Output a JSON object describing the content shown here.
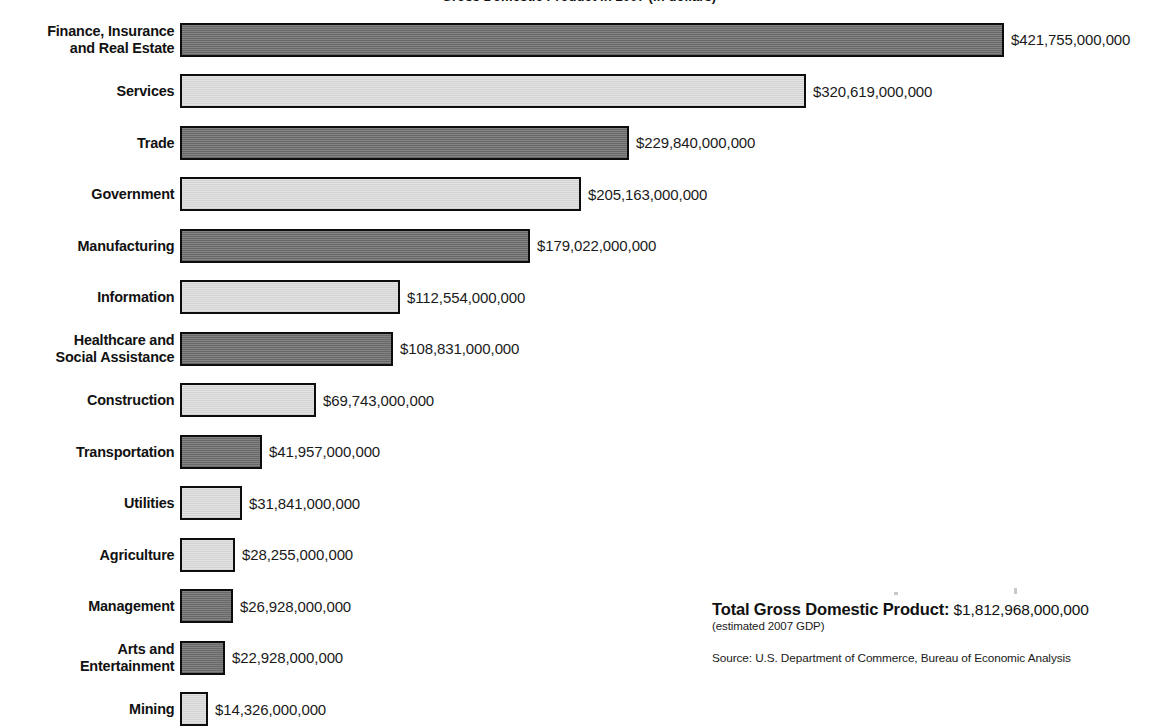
{
  "chart_data": {
    "type": "bar",
    "orientation": "horizontal",
    "title": "Gross Domestic Product in 2007 (in dollars)",
    "xlabel": "",
    "ylabel": "",
    "grid": false,
    "legend": "none",
    "value_prefix": "$",
    "categories": [
      "Finance, Insurance\nand Real Estate",
      "Services",
      "Trade",
      "Government",
      "Manufacturing",
      "Information",
      "Healthcare and\nSocial Assistance",
      "Construction",
      "Transportation",
      "Utilities",
      "Agriculture",
      "Management",
      "Arts and\nEntertainment",
      "Mining"
    ],
    "values": [
      421755000000,
      320619000000,
      229840000000,
      205163000000,
      179022000000,
      112554000000,
      108831000000,
      69743000000,
      41957000000,
      31841000000,
      28255000000,
      26928000000,
      22928000000,
      14326000000
    ],
    "value_labels": [
      "$421,755,000,000",
      "$320,619,000,000",
      "$229,840,000,000",
      "$205,163,000,000",
      "$179,022,000,000",
      "$112,554,000,000",
      "$108,831,000,000",
      "$69,743,000,000",
      "$41,957,000,000",
      "$31,841,000,000",
      "$28,255,000,000",
      "$26,928,000,000",
      "$22,928,000,000",
      "$14,326,000,000"
    ],
    "bar_shades": [
      "dark",
      "light",
      "dark",
      "light",
      "dark",
      "light",
      "dark",
      "light",
      "dark",
      "light",
      "light",
      "dark",
      "dark",
      "light"
    ],
    "xlim": [
      0,
      440000000000
    ],
    "colors": {
      "bar_dark": "#6d6d6d",
      "bar_light": "#dedede",
      "bar_border": "#0d0d0d",
      "text": "#1a1a1a",
      "background": "#ffffff"
    }
  },
  "footer": {
    "total_label": "Total Gross Domestic Product:",
    "total_value": "$1,812,968,000,000",
    "total_note": "(estimated 2007 GDP)",
    "source": "Source: U.S. Department of Commerce, Bureau of Economic Analysis"
  }
}
